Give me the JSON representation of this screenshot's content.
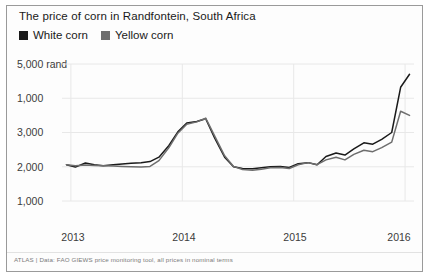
{
  "title": "The price of corn in Randfontein, South Africa",
  "footer": "ATLAS | Data: FAO GIEWS price monitoring tool, all prices in nominal terms",
  "legend": {
    "position": "top-left",
    "entries": [
      {
        "label": "White corn",
        "color": "#1a1a1a",
        "icon": "square-marker"
      },
      {
        "label": "Yellow corn",
        "color": "#6e6e6e",
        "icon": "square-marker"
      }
    ]
  },
  "axes": {
    "y_ticks": [
      "5,000 rand",
      "1,000",
      "3,000",
      "2,000",
      "1,000"
    ],
    "y_values": [
      5000,
      4000,
      3000,
      2000,
      1000
    ],
    "x_ticks": [
      "2013",
      "2014",
      "2015",
      "2016"
    ]
  },
  "chart_data": {
    "type": "line",
    "title": "The price of corn in Randfontein, South Africa",
    "xlabel": "",
    "ylabel": "rand",
    "ylim": [
      1000,
      5000
    ],
    "xlim": [
      2012.92,
      2016.08
    ],
    "grid": true,
    "legend_position": "top-left",
    "y_tick_labels": [
      "5,000 rand",
      "1,000",
      "3,000",
      "2,000",
      "1,000"
    ],
    "y_tick_values": [
      5000,
      4000,
      3000,
      2000,
      1000
    ],
    "x_tick_labels": [
      "2013",
      "2014",
      "2015",
      "2016"
    ],
    "x_tick_values": [
      2013,
      2014,
      2015,
      2016
    ],
    "x": [
      2012.96,
      2013.04,
      2013.13,
      2013.21,
      2013.29,
      2013.38,
      2013.46,
      2013.54,
      2013.63,
      2013.71,
      2013.79,
      2013.88,
      2013.96,
      2014.04,
      2014.13,
      2014.21,
      2014.29,
      2014.38,
      2014.46,
      2014.54,
      2014.63,
      2014.71,
      2014.79,
      2014.88,
      2014.96,
      2015.04,
      2015.13,
      2015.21,
      2015.29,
      2015.38,
      2015.46,
      2015.54,
      2015.63,
      2015.71,
      2015.79,
      2015.88,
      2015.96,
      2016.04
    ],
    "series": [
      {
        "name": "White corn",
        "color": "#1a1a1a",
        "values": [
          2060,
          1990,
          2110,
          2060,
          2030,
          2060,
          2080,
          2100,
          2120,
          2150,
          2280,
          2620,
          3020,
          3280,
          3320,
          3400,
          2840,
          2280,
          2000,
          1950,
          1940,
          1970,
          2000,
          2010,
          1980,
          2090,
          2120,
          2060,
          2300,
          2400,
          2340,
          2520,
          2700,
          2660,
          2800,
          3000,
          4320,
          4700
        ]
      },
      {
        "name": "Yellow corn",
        "color": "#6e6e6e",
        "values": [
          2060,
          2030,
          2050,
          2040,
          2030,
          2020,
          2010,
          2000,
          1990,
          2010,
          2180,
          2560,
          2980,
          3240,
          3310,
          3420,
          2900,
          2320,
          2010,
          1920,
          1900,
          1930,
          1970,
          1980,
          1950,
          2060,
          2120,
          2060,
          2200,
          2280,
          2200,
          2360,
          2480,
          2440,
          2560,
          2720,
          3620,
          3500
        ]
      }
    ]
  }
}
